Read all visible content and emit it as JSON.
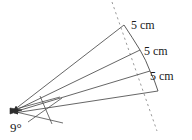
{
  "figure": {
    "type": "geometry-diagram",
    "stroke_color": "#3a3a3a",
    "text_color": "#1a1a1a",
    "background_color": "#ffffff",
    "apex": {
      "x": 13,
      "y": 110,
      "label": "9°",
      "angle_degrees": 9
    },
    "segment_labels": [
      {
        "id": "len-0",
        "text": "5 cm"
      },
      {
        "id": "len-1",
        "text": "5 cm"
      },
      {
        "id": "len-2",
        "text": "5 cm"
      }
    ],
    "reference_line": {
      "name": "dashed-reference-line",
      "style": "dashed",
      "top_point": {
        "x": 112,
        "y": 2
      },
      "bottom_point": {
        "x": 157,
        "y": 131
      }
    },
    "rays": [
      {
        "name": "ray-1",
        "end": {
          "x": 124,
          "y": 25
        }
      },
      {
        "name": "ray-2",
        "end": {
          "x": 140,
          "y": 50
        }
      },
      {
        "name": "ray-3",
        "end": {
          "x": 150,
          "y": 71
        }
      },
      {
        "name": "ray-4",
        "end": {
          "x": 158,
          "y": 91
        }
      }
    ]
  }
}
